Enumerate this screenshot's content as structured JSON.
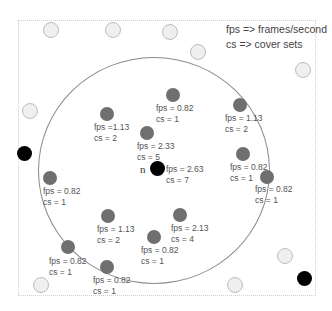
{
  "legend": {
    "line1": "fps => frames/second",
    "line2": "cs => cover sets"
  },
  "focus_node": {
    "label": "n",
    "fps": "fps = 2.63",
    "cs": "cs = 7"
  },
  "sensors_in_range": [
    {
      "fps": "fps = 0.82",
      "cs": "cs = 1"
    },
    {
      "fps": "fps =1.13",
      "cs": "cs = 2"
    },
    {
      "fps": "fps = 2.33",
      "cs": "cs = 5"
    },
    {
      "fps": "fps = 1.13",
      "cs": "cs = 2"
    },
    {
      "fps": "fps = 0.82",
      "cs": "cs = 1"
    },
    {
      "fps": "fps = 0.82",
      "cs": "cs = 1"
    },
    {
      "fps": "fps = 0.82",
      "cs": "cs = 1"
    },
    {
      "fps": "fps = 1.13",
      "cs": "cs = 2"
    },
    {
      "fps": "fps = 2.13",
      "cs": "cs = 4"
    },
    {
      "fps": "fps = 0.82",
      "cs": "cs = 1"
    },
    {
      "fps": "fps = 0.82",
      "cs": "cs = 1"
    },
    {
      "fps": "fps = 0.82",
      "cs": "cs = 1"
    }
  ],
  "colors": {
    "sensor": "#6f6f6f",
    "empty_node": "#efefef",
    "black_node": "#000000",
    "range_circle": "#8a8a8a"
  }
}
